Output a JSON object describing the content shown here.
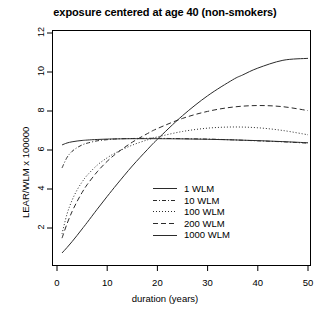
{
  "chart_data": {
    "type": "line",
    "title": "exposure centered at age 40 (non-smokers)",
    "xlabel": "duration (years)",
    "ylabel": "LEAR/WLM x 100000",
    "xlim": [
      0,
      52
    ],
    "ylim": [
      0.6,
      12.4
    ],
    "xticks": [
      0,
      10,
      20,
      30,
      40,
      50
    ],
    "yticks": [
      2,
      4,
      6,
      8,
      10,
      12
    ],
    "xtick_labels": [
      "0",
      "10",
      "20",
      "30",
      "40",
      "50"
    ],
    "ytick_labels": [
      "2",
      "4",
      "6",
      "8",
      "10",
      "12"
    ],
    "grid": false,
    "legend_position": "center-right",
    "box": true,
    "series": [
      {
        "name": "1 WLM",
        "style": "solid",
        "color": "#2b2b2b",
        "x": [
          1,
          2,
          3,
          4,
          5,
          6,
          8,
          10,
          12,
          15,
          18,
          20,
          25,
          30,
          35,
          40,
          45,
          50
        ],
        "y": [
          6.26,
          6.36,
          6.42,
          6.46,
          6.49,
          6.51,
          6.54,
          6.56,
          6.57,
          6.58,
          6.58,
          6.58,
          6.57,
          6.55,
          6.52,
          6.48,
          6.43,
          6.37
        ]
      },
      {
        "name": "10 WLM",
        "style": "dashdot",
        "color": "#2b2b2b",
        "x": [
          1,
          2,
          3,
          4,
          5,
          6,
          8,
          10,
          12,
          15,
          18,
          20,
          25,
          30,
          35,
          40,
          45,
          50
        ],
        "y": [
          5.08,
          5.62,
          5.93,
          6.12,
          6.26,
          6.35,
          6.47,
          6.53,
          6.57,
          6.59,
          6.6,
          6.6,
          6.58,
          6.56,
          6.52,
          6.47,
          6.42,
          6.35
        ]
      },
      {
        "name": "100 WLM",
        "style": "dotted",
        "color": "#2b2b2b",
        "x": [
          1,
          2,
          3,
          4,
          5,
          6,
          8,
          10,
          12,
          15,
          18,
          20,
          25,
          30,
          35,
          40,
          45,
          50
        ],
        "y": [
          1.7,
          2.72,
          3.42,
          3.95,
          4.36,
          4.7,
          5.22,
          5.6,
          5.9,
          6.25,
          6.52,
          6.67,
          6.95,
          7.12,
          7.18,
          7.14,
          7.0,
          6.78
        ]
      },
      {
        "name": "200 WLM",
        "style": "dashed",
        "color": "#2b2b2b",
        "x": [
          1,
          2,
          3,
          4,
          5,
          6,
          8,
          10,
          12,
          15,
          18,
          20,
          25,
          30,
          35,
          40,
          45,
          50
        ],
        "y": [
          1.48,
          2.22,
          2.84,
          3.36,
          3.82,
          4.22,
          4.88,
          5.42,
          5.86,
          6.4,
          6.84,
          7.1,
          7.62,
          7.98,
          8.2,
          8.28,
          8.22,
          8.02
        ]
      },
      {
        "name": "1000 WLM",
        "style": "solid",
        "color": "#2b2b2b",
        "x": [
          1,
          2,
          3,
          4,
          5,
          6,
          8,
          10,
          12,
          15,
          18,
          20,
          25,
          30,
          35,
          37,
          40,
          45,
          50
        ],
        "y": [
          0.72,
          1.0,
          1.3,
          1.62,
          1.95,
          2.28,
          2.96,
          3.62,
          4.26,
          5.18,
          6.02,
          6.55,
          7.76,
          8.78,
          9.6,
          9.85,
          10.2,
          10.6,
          10.7
        ]
      }
    ]
  }
}
